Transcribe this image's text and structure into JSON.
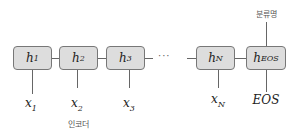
{
  "diagram": {
    "cells": [
      {
        "main": "h",
        "sub": "1"
      },
      {
        "main": "h",
        "sub": "2"
      },
      {
        "main": "h",
        "sub": "3"
      },
      {
        "main": "h",
        "sub": "N"
      },
      {
        "main": "h",
        "sub": "EOS"
      }
    ],
    "inputs": [
      {
        "main": "x",
        "sub": "1"
      },
      {
        "main": "x",
        "sub": "2"
      },
      {
        "main": "x",
        "sub": "3"
      },
      {
        "main": "x",
        "sub": "N"
      },
      {
        "main": "EOS",
        "sub": ""
      }
    ],
    "ellipsis": "···",
    "encoder_label": "인코더",
    "output_label": "분류명"
  }
}
